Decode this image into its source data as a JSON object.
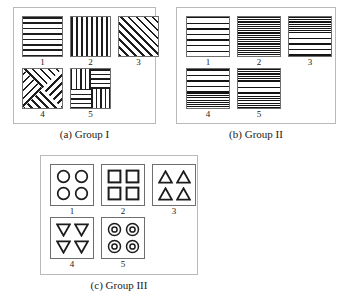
{
  "figure": {
    "panels": [
      {
        "id": "a",
        "caption": "(a) Group I",
        "cells": [
          {
            "label": "1",
            "pattern": "horizontal-stripes"
          },
          {
            "label": "2",
            "pattern": "vertical-stripes"
          },
          {
            "label": "3",
            "pattern": "diagonal-stripes"
          },
          {
            "label": "4",
            "pattern": "chevron-x-stripes"
          },
          {
            "label": "5",
            "pattern": "quadrant-crossed-stripes"
          }
        ]
      },
      {
        "id": "b",
        "caption": "(b) Group II",
        "cells": [
          {
            "label": "1",
            "pattern": "low-frequency-horizontal-stripes"
          },
          {
            "label": "2",
            "pattern": "high-frequency-horizontal-stripes"
          },
          {
            "label": "3",
            "pattern": "dense-top-sparse-bottom-stripes"
          },
          {
            "label": "4",
            "pattern": "sparse-top-dense-bottom-stripes"
          },
          {
            "label": "5",
            "pattern": "dense-edges-sparse-middle-stripes"
          }
        ]
      },
      {
        "id": "c",
        "caption": "(c) Group III",
        "cells": [
          {
            "label": "1",
            "pattern": "circles"
          },
          {
            "label": "2",
            "pattern": "squares"
          },
          {
            "label": "3",
            "pattern": "up-triangles"
          },
          {
            "label": "4",
            "pattern": "down-triangles"
          },
          {
            "label": "5",
            "pattern": "concentric-circles"
          }
        ]
      }
    ]
  },
  "colors": {
    "stroke": "#1c1c1c",
    "panel_border": "#b9b9b9",
    "swatch_border": "#6e6e6e",
    "background": "#ffffff"
  }
}
